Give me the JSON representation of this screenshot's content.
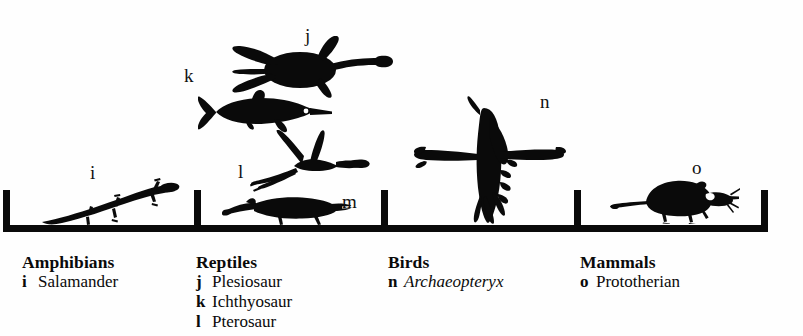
{
  "figure": {
    "type": "taxonomic-silhouette-chart",
    "background_color": "#fefefe",
    "ink_color": "#0a0a0a"
  },
  "axis": {
    "name": "baseline-bracket",
    "left": 3,
    "right": 767,
    "divider_positions": [
      3,
      197,
      384,
      577,
      765
    ]
  },
  "key_letters": [
    {
      "id": "i",
      "label": "i",
      "x": 90,
      "y": 163
    },
    {
      "id": "j",
      "label": "j",
      "x": 305,
      "y": 26
    },
    {
      "id": "k",
      "label": "k",
      "x": 184,
      "y": 66
    },
    {
      "id": "l",
      "label": "l",
      "x": 238,
      "y": 162
    },
    {
      "id": "m",
      "label": "m",
      "x": 342,
      "y": 192
    },
    {
      "id": "n",
      "label": "n",
      "x": 540,
      "y": 92
    },
    {
      "id": "o",
      "label": "o",
      "x": 692,
      "y": 158
    }
  ],
  "silhouettes": [
    {
      "id": "i",
      "name": "salamander-silhouette",
      "group": "Amphibians"
    },
    {
      "id": "j",
      "name": "plesiosaur-silhouette",
      "group": "Reptiles"
    },
    {
      "id": "k",
      "name": "ichthyosaur-silhouette",
      "group": "Reptiles"
    },
    {
      "id": "l",
      "name": "pterosaur-silhouette",
      "group": "Reptiles"
    },
    {
      "id": "m",
      "name": "crocodilian-silhouette",
      "group": "Reptiles"
    },
    {
      "id": "n",
      "name": "archaeopteryx-silhouette",
      "group": "Birds"
    },
    {
      "id": "o",
      "name": "protothere-silhouette",
      "group": "Mammals"
    }
  ],
  "caption": {
    "columns": [
      {
        "title": "Amphibians",
        "x": 22,
        "entries": [
          {
            "letter": "i",
            "name": "Salamander",
            "italic": false
          }
        ]
      },
      {
        "title": "Reptiles",
        "x": 196,
        "entries": [
          {
            "letter": "j",
            "name": "Plesiosaur",
            "italic": false
          },
          {
            "letter": "k",
            "name": "Ichthyosaur",
            "italic": false
          },
          {
            "letter": "l",
            "name": "Pterosaur",
            "italic": false
          }
        ]
      },
      {
        "title": "Birds",
        "x": 388,
        "entries": [
          {
            "letter": "n",
            "name": "Archaeopteryx",
            "italic": true
          }
        ]
      },
      {
        "title": "Mammals",
        "x": 580,
        "entries": [
          {
            "letter": "o",
            "name": "Prototherian",
            "italic": false
          }
        ]
      }
    ]
  }
}
